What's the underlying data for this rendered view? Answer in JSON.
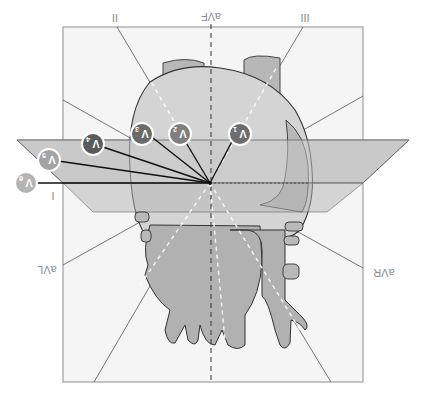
{
  "figure": {
    "orientation": "rotated-180",
    "limb_leads": {
      "lead_II": "II",
      "lead_aVF": "aVF",
      "lead_III": "III",
      "lead_I": "I",
      "lead_aVL": "aVL",
      "lead_aVR": "aVR"
    },
    "precordial_leads": [
      {
        "label": "V",
        "sub": "1",
        "color": "#6d6d6d"
      },
      {
        "label": "V",
        "sub": "2",
        "color": "#7e7e7e"
      },
      {
        "label": "V",
        "sub": "3",
        "color": "#6a6a6a"
      },
      {
        "label": "V",
        "sub": "4",
        "color": "#5a5a5a"
      },
      {
        "label": "V",
        "sub": "5",
        "color": "#a3a3a3"
      },
      {
        "label": "V",
        "sub": "6",
        "color": "#b4b4b4"
      }
    ],
    "colors": {
      "frame_fill": "#f4f4f4",
      "frame_stroke": "#9a9a9a",
      "heart_light": "#d6d6d6",
      "heart_mid": "#bdbdbd",
      "heart_dark": "#a9a9a9",
      "plane_fill": "#c9c9c9",
      "label_text": "#8c8c8c"
    }
  }
}
